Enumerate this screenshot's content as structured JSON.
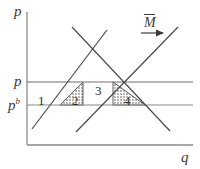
{
  "figure": {
    "kind": "economics-supply-demand-diagram",
    "background_color": "#ffffff",
    "line_color": "#4a4a4a",
    "axis_color": "#7a7a7a",
    "text_color": "#3b3b3b",
    "width": 200,
    "height": 169
  },
  "axes": {
    "y_label": "p",
    "x_label": "q"
  },
  "price_lines": [
    {
      "name": "p-line",
      "label": "p",
      "y": 82
    },
    {
      "name": "pb-line",
      "label": "p",
      "superscript": "b",
      "y": 105
    }
  ],
  "annotations": {
    "money_supply": {
      "label": "M",
      "overbar": true,
      "arrow": "right-arrow"
    }
  },
  "regions": [
    {
      "id": "region-1",
      "label": "1",
      "shaded": false
    },
    {
      "id": "region-2",
      "label": "2",
      "shaded": true
    },
    {
      "id": "region-3",
      "label": "3",
      "shaded": false
    },
    {
      "id": "region-4",
      "label": "4",
      "shaded": true
    }
  ],
  "curves": [
    {
      "name": "supply-curve-left",
      "direction": "upward-sloping"
    },
    {
      "name": "supply-curve-right",
      "direction": "upward-sloping"
    },
    {
      "name": "demand-curve",
      "direction": "downward-sloping"
    }
  ]
}
